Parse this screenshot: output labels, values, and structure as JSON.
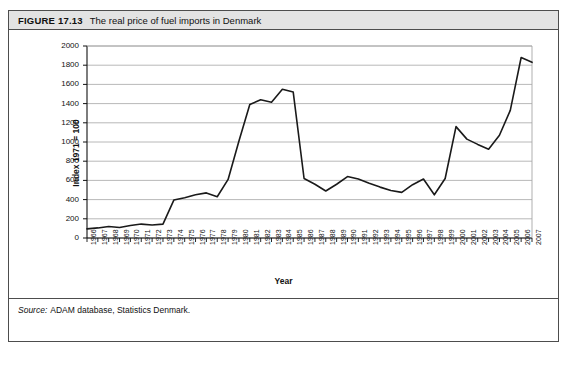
{
  "figure": {
    "number": "FIGURE 17.13",
    "title": "The real price of fuel imports in Denmark",
    "source_label": "Source:",
    "source_text": "ADAM database, Statistics Denmark."
  },
  "colors": {
    "header_bg": "#e3e3e3",
    "border": "#4d4d4d",
    "line": "#1a1a1a",
    "grid": "#a6a6a6",
    "text": "#111111"
  },
  "chart_data": {
    "type": "line",
    "title": "The real price of fuel imports in Denmark",
    "xlabel": "Year",
    "ylabel": "Index 1971 = 100",
    "ylim": [
      0,
      2000
    ],
    "ytick_step": 200,
    "yticks": [
      0,
      200,
      400,
      600,
      800,
      1000,
      1200,
      1400,
      1600,
      1800,
      2000
    ],
    "grid": true,
    "legend": false,
    "x": [
      "1966",
      "1967",
      "1968",
      "1969",
      "1970",
      "1971",
      "1972",
      "1973",
      "1974",
      "1975",
      "1976",
      "1977",
      "1978",
      "1979",
      "1980",
      "1981",
      "1982",
      "1983",
      "1984",
      "1985",
      "1986",
      "1987",
      "1988",
      "1989",
      "1990",
      "1991",
      "1992",
      "1993",
      "1994",
      "1995",
      "1996",
      "1997",
      "1998",
      "1999",
      "2000",
      "2001",
      "2002",
      "2003",
      "2004",
      "2005",
      "2006",
      "2007"
    ],
    "series": [
      {
        "name": "Real price of fuel imports",
        "values": [
          95,
          105,
          120,
          110,
          130,
          145,
          135,
          145,
          395,
          420,
          450,
          470,
          430,
          610,
          1010,
          1390,
          1440,
          1415,
          1550,
          1520,
          620,
          560,
          490,
          560,
          640,
          615,
          570,
          530,
          495,
          475,
          555,
          615,
          450,
          620,
          1160,
          1030,
          975,
          925,
          1070,
          1330,
          1880,
          1830
        ]
      }
    ]
  }
}
